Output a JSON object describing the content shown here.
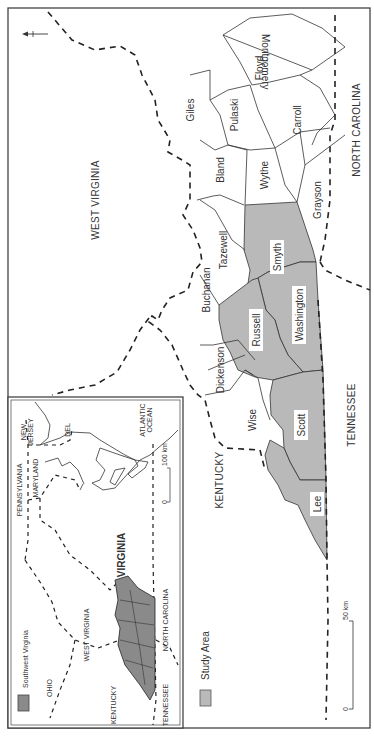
{
  "map": {
    "orientation": "rotated 90 degrees clockwise (north points left)",
    "north_arrow": {
      "icon": "north-arrow-icon",
      "label": "N"
    },
    "states": {
      "west_virginia": "WEST VIRGINIA",
      "north_carolina": "NORTH CAROLINA",
      "tennessee": "TENNESSEE",
      "kentucky": "KENTUCKY"
    },
    "counties": [
      {
        "name": "Montgomery",
        "study_area": false
      },
      {
        "name": "Floyd",
        "study_area": false
      },
      {
        "name": "Giles",
        "study_area": false
      },
      {
        "name": "Pulaski",
        "study_area": false
      },
      {
        "name": "Carroll",
        "study_area": false
      },
      {
        "name": "Bland",
        "study_area": false
      },
      {
        "name": "Wythe",
        "study_area": false
      },
      {
        "name": "Grayson",
        "study_area": false
      },
      {
        "name": "Tazewell",
        "study_area": false
      },
      {
        "name": "Smyth",
        "study_area": true
      },
      {
        "name": "Buchanan",
        "study_area": false
      },
      {
        "name": "Russell",
        "study_area": true
      },
      {
        "name": "Washington",
        "study_area": true
      },
      {
        "name": "Dickenson",
        "study_area": false
      },
      {
        "name": "Wise",
        "study_area": false
      },
      {
        "name": "Scott",
        "study_area": true
      },
      {
        "name": "Lee",
        "study_area": true
      }
    ],
    "legend": {
      "swatch_color": "#b9b9b9",
      "label": "Study Area"
    },
    "scale_bar": {
      "start": "0",
      "end": "50 km"
    },
    "colors": {
      "study_area": "#b9b9b9",
      "lines": "#333333",
      "background": "#ffffff"
    }
  },
  "inset": {
    "states": {
      "new_jersey": "NEW JERSEY",
      "del": "DEL",
      "pennsylvania": "PENNSYLVANIA",
      "maryland": "MARYLAND",
      "atlantic_ocean": "ATLANTIC OCEAN",
      "ohio": "OHIO",
      "west_virginia": "WEST VIRGINIA",
      "virginia": "VIRGINIA",
      "north_carolina": "NORTH CAROLINA",
      "kentucky": "KENTUCKY",
      "tennessee": "TENNESSEE"
    },
    "legend": {
      "swatch_color": "#8a8a8a",
      "label": "Southwest Virginia"
    },
    "scale_bar": {
      "start": "0",
      "end": "100 km"
    }
  }
}
